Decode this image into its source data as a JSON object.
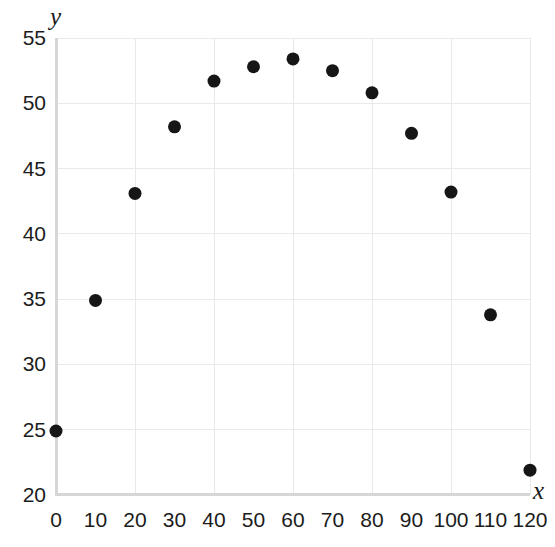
{
  "chart_data": {
    "type": "scatter",
    "title": "",
    "xlabel": "x",
    "ylabel": "y",
    "xlim": [
      0,
      120
    ],
    "ylim": [
      20,
      55
    ],
    "xticks": [
      0,
      10,
      20,
      30,
      40,
      50,
      60,
      70,
      80,
      90,
      100,
      110,
      120
    ],
    "yticks": [
      20,
      25,
      30,
      35,
      40,
      45,
      50,
      55
    ],
    "xtick_labels": [
      "0",
      "10",
      "20",
      "30",
      "40",
      "50",
      "60",
      "70",
      "80",
      "90",
      "100",
      "110",
      "120"
    ],
    "ytick_labels": [
      "20",
      "25",
      "30",
      "35",
      "40",
      "45",
      "50",
      "55"
    ],
    "x_gridlines": [
      0,
      20,
      40,
      60,
      80,
      100,
      120
    ],
    "y_gridlines": [
      20,
      25,
      30,
      35,
      40,
      45,
      50,
      55
    ],
    "grid": true,
    "legend": false,
    "marker": "filled-circle",
    "marker_color": "#161616",
    "marker_size": 13,
    "x": [
      0,
      10,
      20,
      30,
      40,
      50,
      60,
      70,
      80,
      90,
      100,
      110,
      120
    ],
    "values": [
      24.9,
      34.9,
      43.1,
      48.2,
      51.7,
      52.8,
      53.4,
      52.5,
      50.8,
      47.7,
      43.2,
      33.8,
      21.9
    ],
    "series": [
      {
        "name": "",
        "x": [
          0,
          10,
          20,
          30,
          40,
          50,
          60,
          70,
          80,
          90,
          100,
          110,
          120
        ],
        "values": [
          24.9,
          34.9,
          43.1,
          48.2,
          51.7,
          52.8,
          53.4,
          52.5,
          50.8,
          47.7,
          43.2,
          33.8,
          21.9
        ]
      }
    ],
    "colors": {
      "marker": "#161616",
      "grid": "#e9e9e9",
      "axis": "#d6d6d6",
      "text": "#1c1c1c",
      "background": "#ffffff"
    }
  }
}
